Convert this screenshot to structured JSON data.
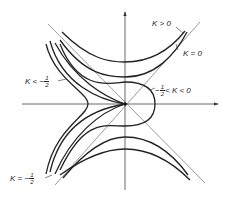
{
  "figure": {
    "type": "level-curves-diagram",
    "axes": {
      "x_arrow": true,
      "y_arrow": true
    },
    "colors": {
      "curve": "#222222",
      "axis": "#444444",
      "asymptote": "#555555",
      "background": "#ffffff"
    }
  },
  "labels": {
    "k_positive": {
      "prefix": "K > 0",
      "text": "K > 0"
    },
    "k_zero": {
      "text": "K = 0"
    },
    "k_less_half": {
      "prefix": "K < −",
      "num": "1",
      "den": "2"
    },
    "k_between": {
      "prefix": "−",
      "num": "1",
      "den": "2",
      "suffix": "< K < 0"
    },
    "k_equal_half": {
      "prefix": "K = −",
      "num": "1",
      "den": "2"
    }
  }
}
